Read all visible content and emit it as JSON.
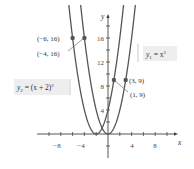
{
  "chart_data": {
    "type": "line",
    "title": "",
    "xlabel": "x",
    "ylabel": "y",
    "xlim": [
      -11,
      11
    ],
    "ylim": [
      -4,
      19
    ],
    "x_ticks": [
      -10,
      -8,
      -6,
      -4,
      -2,
      2,
      4,
      6,
      8,
      10
    ],
    "x_tick_labels": [
      "-8",
      "-4",
      "4",
      "8"
    ],
    "x_tick_label_values": [
      -8,
      -4,
      4,
      8
    ],
    "y_ticks": [
      2,
      4,
      6,
      8,
      10,
      12,
      14,
      16,
      18
    ],
    "y_tick_labels": [
      "4",
      "8",
      "12",
      "16"
    ],
    "y_tick_label_values": [
      4,
      8,
      12,
      16
    ],
    "grid": false,
    "series": [
      {
        "name": "y1 = x^2",
        "label": "y₁ = x²",
        "expression": "x^2",
        "color": "#555555"
      },
      {
        "name": "y2 = (x+2)^2",
        "label": "y₂ = (x + 2)²",
        "expression": "(x+2)^2",
        "color": "#555555"
      }
    ],
    "points": [
      {
        "x": -6,
        "y": 16,
        "label": "(−6, 16)",
        "series": "y2"
      },
      {
        "x": -4,
        "y": 16,
        "label": "(−4, 16)",
        "series": "y1"
      },
      {
        "x": 1,
        "y": 9,
        "label": "(1, 9)",
        "series": "y2"
      },
      {
        "x": 3,
        "y": 9,
        "label": "(3, 9)",
        "series": "y1"
      }
    ],
    "annotations": [
      "y₁ = x²",
      "y₂ = (x + 2)²"
    ]
  },
  "labels": {
    "x_axis": "x",
    "y_axis": "y",
    "y1": "y",
    "y1_sub": "1",
    "y1_rhs": " = x",
    "y1_exp": "2",
    "y2": "y",
    "y2_sub": "2",
    "y2_rhs": " = (x + 2)",
    "y2_exp": "2",
    "p1": "(−6, 16)",
    "p2": "(−4, 16)",
    "p3": "(3, 9)",
    "p4": "(1, 9)",
    "xt_m8": "−8",
    "xt_m4": "−4",
    "xt_4": "4",
    "xt_8": "8",
    "yt_4": "4",
    "yt_8": "8",
    "yt_12": "12",
    "yt_16": "16"
  }
}
